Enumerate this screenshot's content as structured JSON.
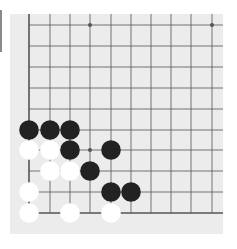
{
  "board": {
    "description": "Go board fragment (lower-left corner)",
    "columns_x": [
      29,
      50,
      70,
      90,
      111,
      131,
      151,
      171,
      191,
      212
    ],
    "rows_y": [
      25,
      46,
      67,
      88,
      109,
      130,
      150,
      171,
      192,
      213
    ],
    "edges": [
      "left",
      "bottom"
    ],
    "star_points": [
      [
        3,
        0
      ],
      [
        9,
        0
      ],
      [
        3,
        6
      ]
    ],
    "colors": {
      "background": "#ececec",
      "line": "#555555",
      "black": "#222222",
      "white": "#ffffff"
    },
    "stones": [
      {
        "color": "black",
        "col": 0,
        "row": 5
      },
      {
        "color": "black",
        "col": 1,
        "row": 5
      },
      {
        "color": "black",
        "col": 2,
        "row": 5
      },
      {
        "color": "white",
        "col": 0,
        "row": 6
      },
      {
        "color": "white",
        "col": 1,
        "row": 6
      },
      {
        "color": "black",
        "col": 2,
        "row": 6
      },
      {
        "color": "black",
        "col": 4,
        "row": 6
      },
      {
        "color": "white",
        "col": 1,
        "row": 7
      },
      {
        "color": "white",
        "col": 2,
        "row": 7
      },
      {
        "color": "black",
        "col": 3,
        "row": 7
      },
      {
        "color": "white",
        "col": 0,
        "row": 8
      },
      {
        "color": "black",
        "col": 4,
        "row": 8
      },
      {
        "color": "black",
        "col": 5,
        "row": 8
      },
      {
        "color": "white",
        "col": 0,
        "row": 9
      },
      {
        "color": "white",
        "col": 2,
        "row": 9
      },
      {
        "color": "white",
        "col": 4,
        "row": 9
      }
    ]
  }
}
